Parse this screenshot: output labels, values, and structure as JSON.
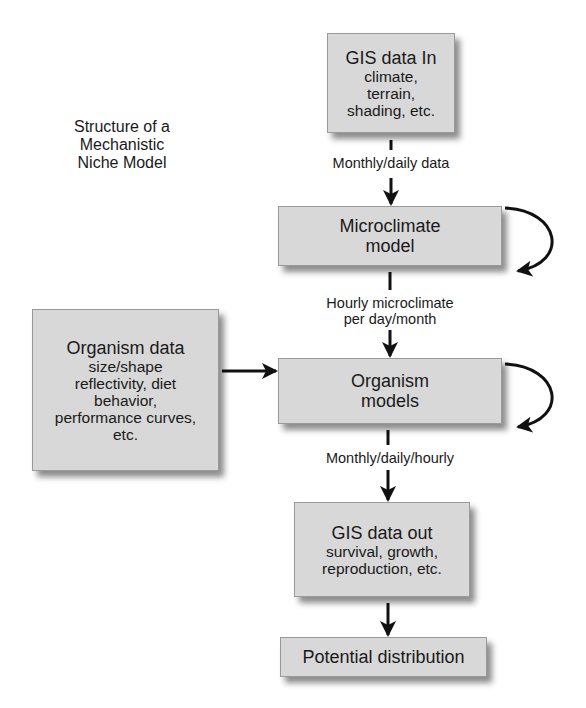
{
  "title": [
    "Structure of a",
    "Mechanistic",
    "Niche Model"
  ],
  "nodes": {
    "gis_in": {
      "head": "GIS data In",
      "sub": [
        "climate,",
        "terrain,",
        "shading, etc."
      ]
    },
    "microclimate": {
      "head": [
        "Microclimate",
        "model"
      ]
    },
    "organism_data": {
      "head": "Organism data",
      "sub": [
        "size/shape",
        "reflectivity, diet",
        "behavior,",
        "performance curves,",
        "etc."
      ]
    },
    "organism_models": {
      "head": [
        "Organism",
        "models"
      ]
    },
    "gis_out": {
      "head": "GIS data out",
      "sub": [
        "survival, growth,",
        "reproduction, etc."
      ]
    },
    "potential": {
      "head": "Potential distribution"
    }
  },
  "edges": {
    "gis_in_to_micro": "Monthly/daily data",
    "micro_to_org": [
      "Hourly microclimate",
      "per day/month"
    ],
    "org_to_out": "Monthly/daily/hourly"
  }
}
